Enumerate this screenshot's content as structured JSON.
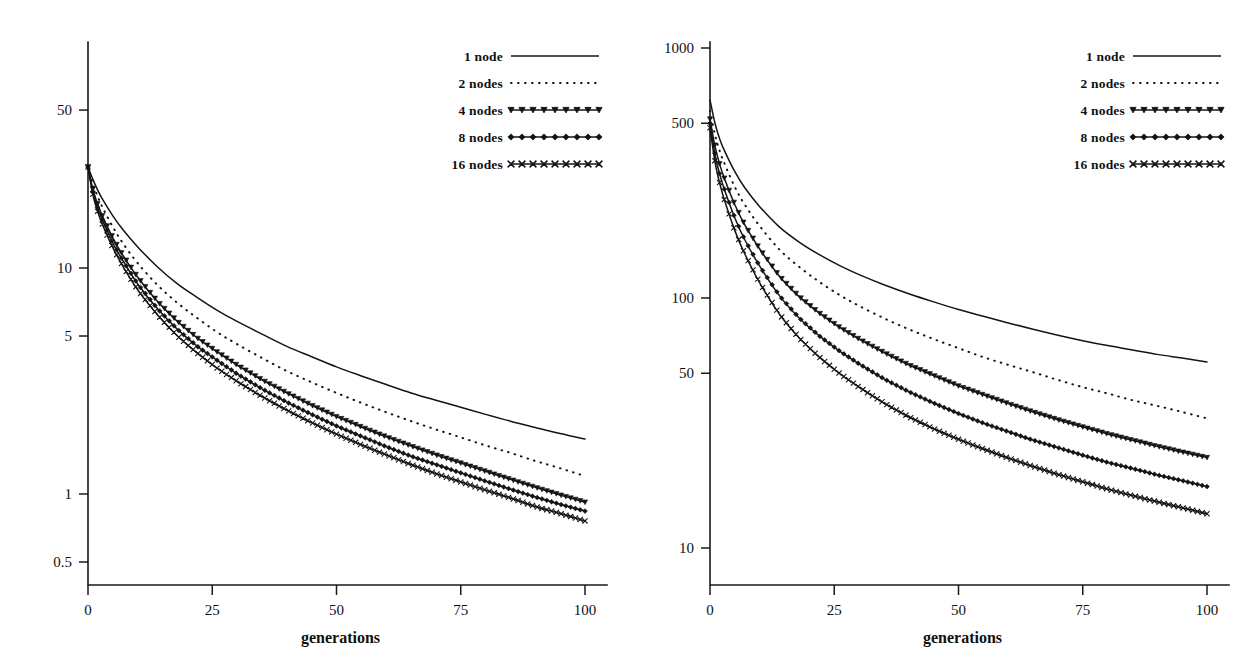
{
  "figure": {
    "background_color": "#ffffff",
    "ink_color": "#141414",
    "panel_count": 2
  },
  "chart_data": [
    {
      "type": "line",
      "panel": "left",
      "title": "",
      "subtitle": "",
      "xlabel": "generations",
      "ylabel": "",
      "xscale": "linear",
      "yscale": "log",
      "xlim": [
        0,
        100
      ],
      "ylim": [
        0.45,
        80
      ],
      "grid": false,
      "legend_position": "top-right",
      "xticks": [
        0,
        25,
        50,
        75,
        100
      ],
      "xticklabels": [
        "0",
        "25",
        "50",
        "75",
        "100"
      ],
      "yticks": [
        50,
        10,
        5,
        1,
        0.5
      ],
      "yticklabels": [
        "50",
        "10",
        "5",
        "1",
        "0.5"
      ],
      "x": [
        0,
        1,
        2,
        3,
        5,
        7,
        10,
        14,
        18,
        22,
        26,
        30,
        35,
        40,
        45,
        50,
        55,
        60,
        65,
        70,
        75,
        80,
        85,
        90,
        95,
        100
      ],
      "series": [
        {
          "name": "1 node",
          "style": "solid",
          "marker": "none",
          "values": [
            28.0,
            24.6,
            22.0,
            20.0,
            17.0,
            14.8,
            12.4,
            10.1,
            8.5,
            7.4,
            6.5,
            5.8,
            5.1,
            4.5,
            4.05,
            3.65,
            3.33,
            3.05,
            2.8,
            2.6,
            2.42,
            2.25,
            2.1,
            1.97,
            1.85,
            1.75
          ]
        },
        {
          "name": "2 nodes",
          "style": "dotted",
          "marker": "none",
          "values": [
            28.0,
            23.5,
            20.6,
            18.4,
            15.2,
            12.9,
            10.5,
            8.4,
            7.0,
            6.0,
            5.2,
            4.6,
            4.0,
            3.5,
            3.12,
            2.8,
            2.53,
            2.3,
            2.1,
            1.93,
            1.78,
            1.64,
            1.52,
            1.4,
            1.3,
            1.2
          ]
        },
        {
          "name": "4 nodes",
          "style": "solid",
          "marker": "triangle",
          "values": [
            28.0,
            22.2,
            19.0,
            16.8,
            13.6,
            11.4,
            9.1,
            7.1,
            5.8,
            4.9,
            4.25,
            3.72,
            3.2,
            2.8,
            2.47,
            2.2,
            1.98,
            1.79,
            1.63,
            1.49,
            1.37,
            1.26,
            1.16,
            1.07,
            0.99,
            0.92
          ]
        },
        {
          "name": "8 nodes",
          "style": "solid",
          "marker": "diamond",
          "values": [
            28.0,
            21.6,
            18.3,
            16.1,
            12.9,
            10.8,
            8.5,
            6.6,
            5.35,
            4.5,
            3.9,
            3.4,
            2.92,
            2.55,
            2.25,
            2.0,
            1.8,
            1.62,
            1.47,
            1.35,
            1.24,
            1.14,
            1.05,
            0.97,
            0.9,
            0.84
          ]
        },
        {
          "name": "16 nodes",
          "style": "solid",
          "marker": "cross",
          "values": [
            28.0,
            21.0,
            17.6,
            15.4,
            12.3,
            10.2,
            8.0,
            6.2,
            5.0,
            4.2,
            3.6,
            3.15,
            2.7,
            2.35,
            2.07,
            1.84,
            1.65,
            1.49,
            1.35,
            1.23,
            1.13,
            1.04,
            0.96,
            0.88,
            0.82,
            0.76
          ]
        }
      ]
    },
    {
      "type": "line",
      "panel": "right",
      "title": "",
      "subtitle": "",
      "xlabel": "generations",
      "ylabel": "",
      "xscale": "linear",
      "yscale": "log",
      "xlim": [
        0,
        100
      ],
      "ylim": [
        9,
        1400
      ],
      "grid": false,
      "legend_position": "top-right",
      "xticks": [
        0,
        25,
        50,
        75,
        100
      ],
      "xticklabels": [
        "0",
        "25",
        "50",
        "75",
        "100"
      ],
      "yticks": [
        1000,
        500,
        100,
        50,
        10
      ],
      "yticklabels": [
        "1000",
        "500",
        "100",
        "50",
        "10"
      ],
      "x": [
        0,
        1,
        2,
        3,
        5,
        7,
        10,
        14,
        18,
        22,
        26,
        30,
        35,
        40,
        45,
        50,
        55,
        60,
        65,
        70,
        75,
        80,
        85,
        90,
        95,
        100
      ],
      "series": [
        {
          "name": "1 node",
          "style": "solid",
          "marker": "none",
          "values": [
            620.0,
            500.0,
            430.0,
            385.0,
            320.0,
            276.0,
            232.0,
            192.0,
            167.0,
            149.0,
            135.0,
            124.0,
            113.0,
            104.0,
            96.5,
            90.0,
            84.5,
            79.5,
            75.0,
            71.0,
            67.5,
            64.5,
            62.0,
            59.5,
            57.5,
            55.5
          ]
        },
        {
          "name": "2 nodes",
          "style": "dotted",
          "marker": "none",
          "values": [
            560.0,
            450.0,
            385.0,
            342.0,
            278.0,
            236.0,
            194.0,
            156.0,
            133.0,
            116.0,
            103.0,
            93.0,
            83.0,
            75.0,
            68.5,
            63.0,
            58.0,
            54.0,
            50.5,
            47.0,
            44.0,
            41.5,
            39.0,
            37.0,
            35.0,
            33.0
          ]
        },
        {
          "name": "4 nodes",
          "style": "solid",
          "marker": "triangle",
          "values": [
            520.0,
            405.0,
            340.0,
            297.0,
            236.0,
            196.0,
            157.0,
            122.0,
            101.0,
            87.0,
            76.5,
            68.5,
            60.5,
            54.0,
            49.0,
            44.5,
            41.0,
            37.8,
            35.0,
            32.6,
            30.5,
            28.6,
            27.0,
            25.5,
            24.2,
            23.0
          ]
        },
        {
          "name": "8 nodes",
          "style": "solid",
          "marker": "diamond",
          "values": [
            500.0,
            375.0,
            310.0,
            268.0,
            209.0,
            171.0,
            134.0,
            102.0,
            83.0,
            70.5,
            61.5,
            54.5,
            47.5,
            42.2,
            38.0,
            34.5,
            31.6,
            29.2,
            27.0,
            25.2,
            23.5,
            22.0,
            20.8,
            19.6,
            18.6,
            17.6
          ]
        },
        {
          "name": "16 nodes",
          "style": "solid",
          "marker": "cross",
          "values": [
            480.0,
            350.0,
            285.0,
            243.0,
            186.0,
            150.0,
            115.0,
            86.0,
            69.0,
            58.0,
            50.0,
            44.0,
            38.0,
            33.5,
            30.0,
            27.2,
            24.9,
            22.9,
            21.2,
            19.7,
            18.4,
            17.2,
            16.2,
            15.3,
            14.5,
            13.7
          ]
        }
      ]
    }
  ],
  "legend": {
    "entries": [
      {
        "label": "1 node",
        "style": "solid",
        "marker": "none"
      },
      {
        "label": "2 nodes",
        "style": "dotted",
        "marker": "none"
      },
      {
        "label": "4 nodes",
        "style": "solid",
        "marker": "triangle"
      },
      {
        "label": "8 nodes",
        "style": "solid",
        "marker": "diamond"
      },
      {
        "label": "16 nodes",
        "style": "solid",
        "marker": "cross"
      }
    ]
  }
}
